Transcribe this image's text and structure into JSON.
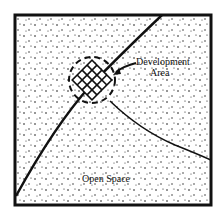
{
  "diagram": {
    "labels": {
      "development_area_line1": "Development",
      "development_area_line2": "Area",
      "open_space": "Open Space"
    },
    "colors": {
      "ink": "#111111",
      "paper": "#ffffff"
    }
  }
}
